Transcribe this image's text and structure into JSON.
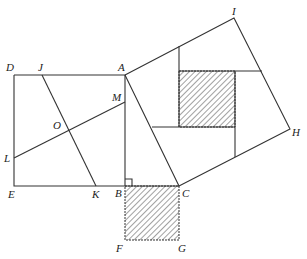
{
  "diagram": {
    "title": "",
    "points": {
      "A": {
        "label": "A",
        "x": 125,
        "y": 75
      },
      "B": {
        "label": "B",
        "x": 125,
        "y": 186
      },
      "C": {
        "label": "C",
        "x": 179,
        "y": 186
      },
      "D": {
        "label": "D",
        "x": 14,
        "y": 75
      },
      "E": {
        "label": "E",
        "x": 14,
        "y": 186
      },
      "F": {
        "label": "F",
        "x": 125,
        "y": 240
      },
      "G": {
        "label": "G",
        "x": 179,
        "y": 240
      },
      "H": {
        "label": "H",
        "x": 290,
        "y": 129
      },
      "I": {
        "label": "I",
        "x": 234,
        "y": 18
      },
      "J": {
        "label": "J",
        "x": 42,
        "y": 75
      },
      "K": {
        "label": "K",
        "x": 96,
        "y": 186
      },
      "L": {
        "label": "L",
        "x": 14,
        "y": 158
      },
      "M": {
        "label": "M",
        "x": 125,
        "y": 102
      },
      "O": {
        "label": "O",
        "x": 69,
        "y": 130
      }
    },
    "shapes": {
      "square_ABED": "square on leg AB (DAEB)",
      "square_BCGF": "hatched square on leg BC",
      "square_ACHI": "square on hypotenuse AC",
      "right_angle_marker": "at B"
    }
  }
}
